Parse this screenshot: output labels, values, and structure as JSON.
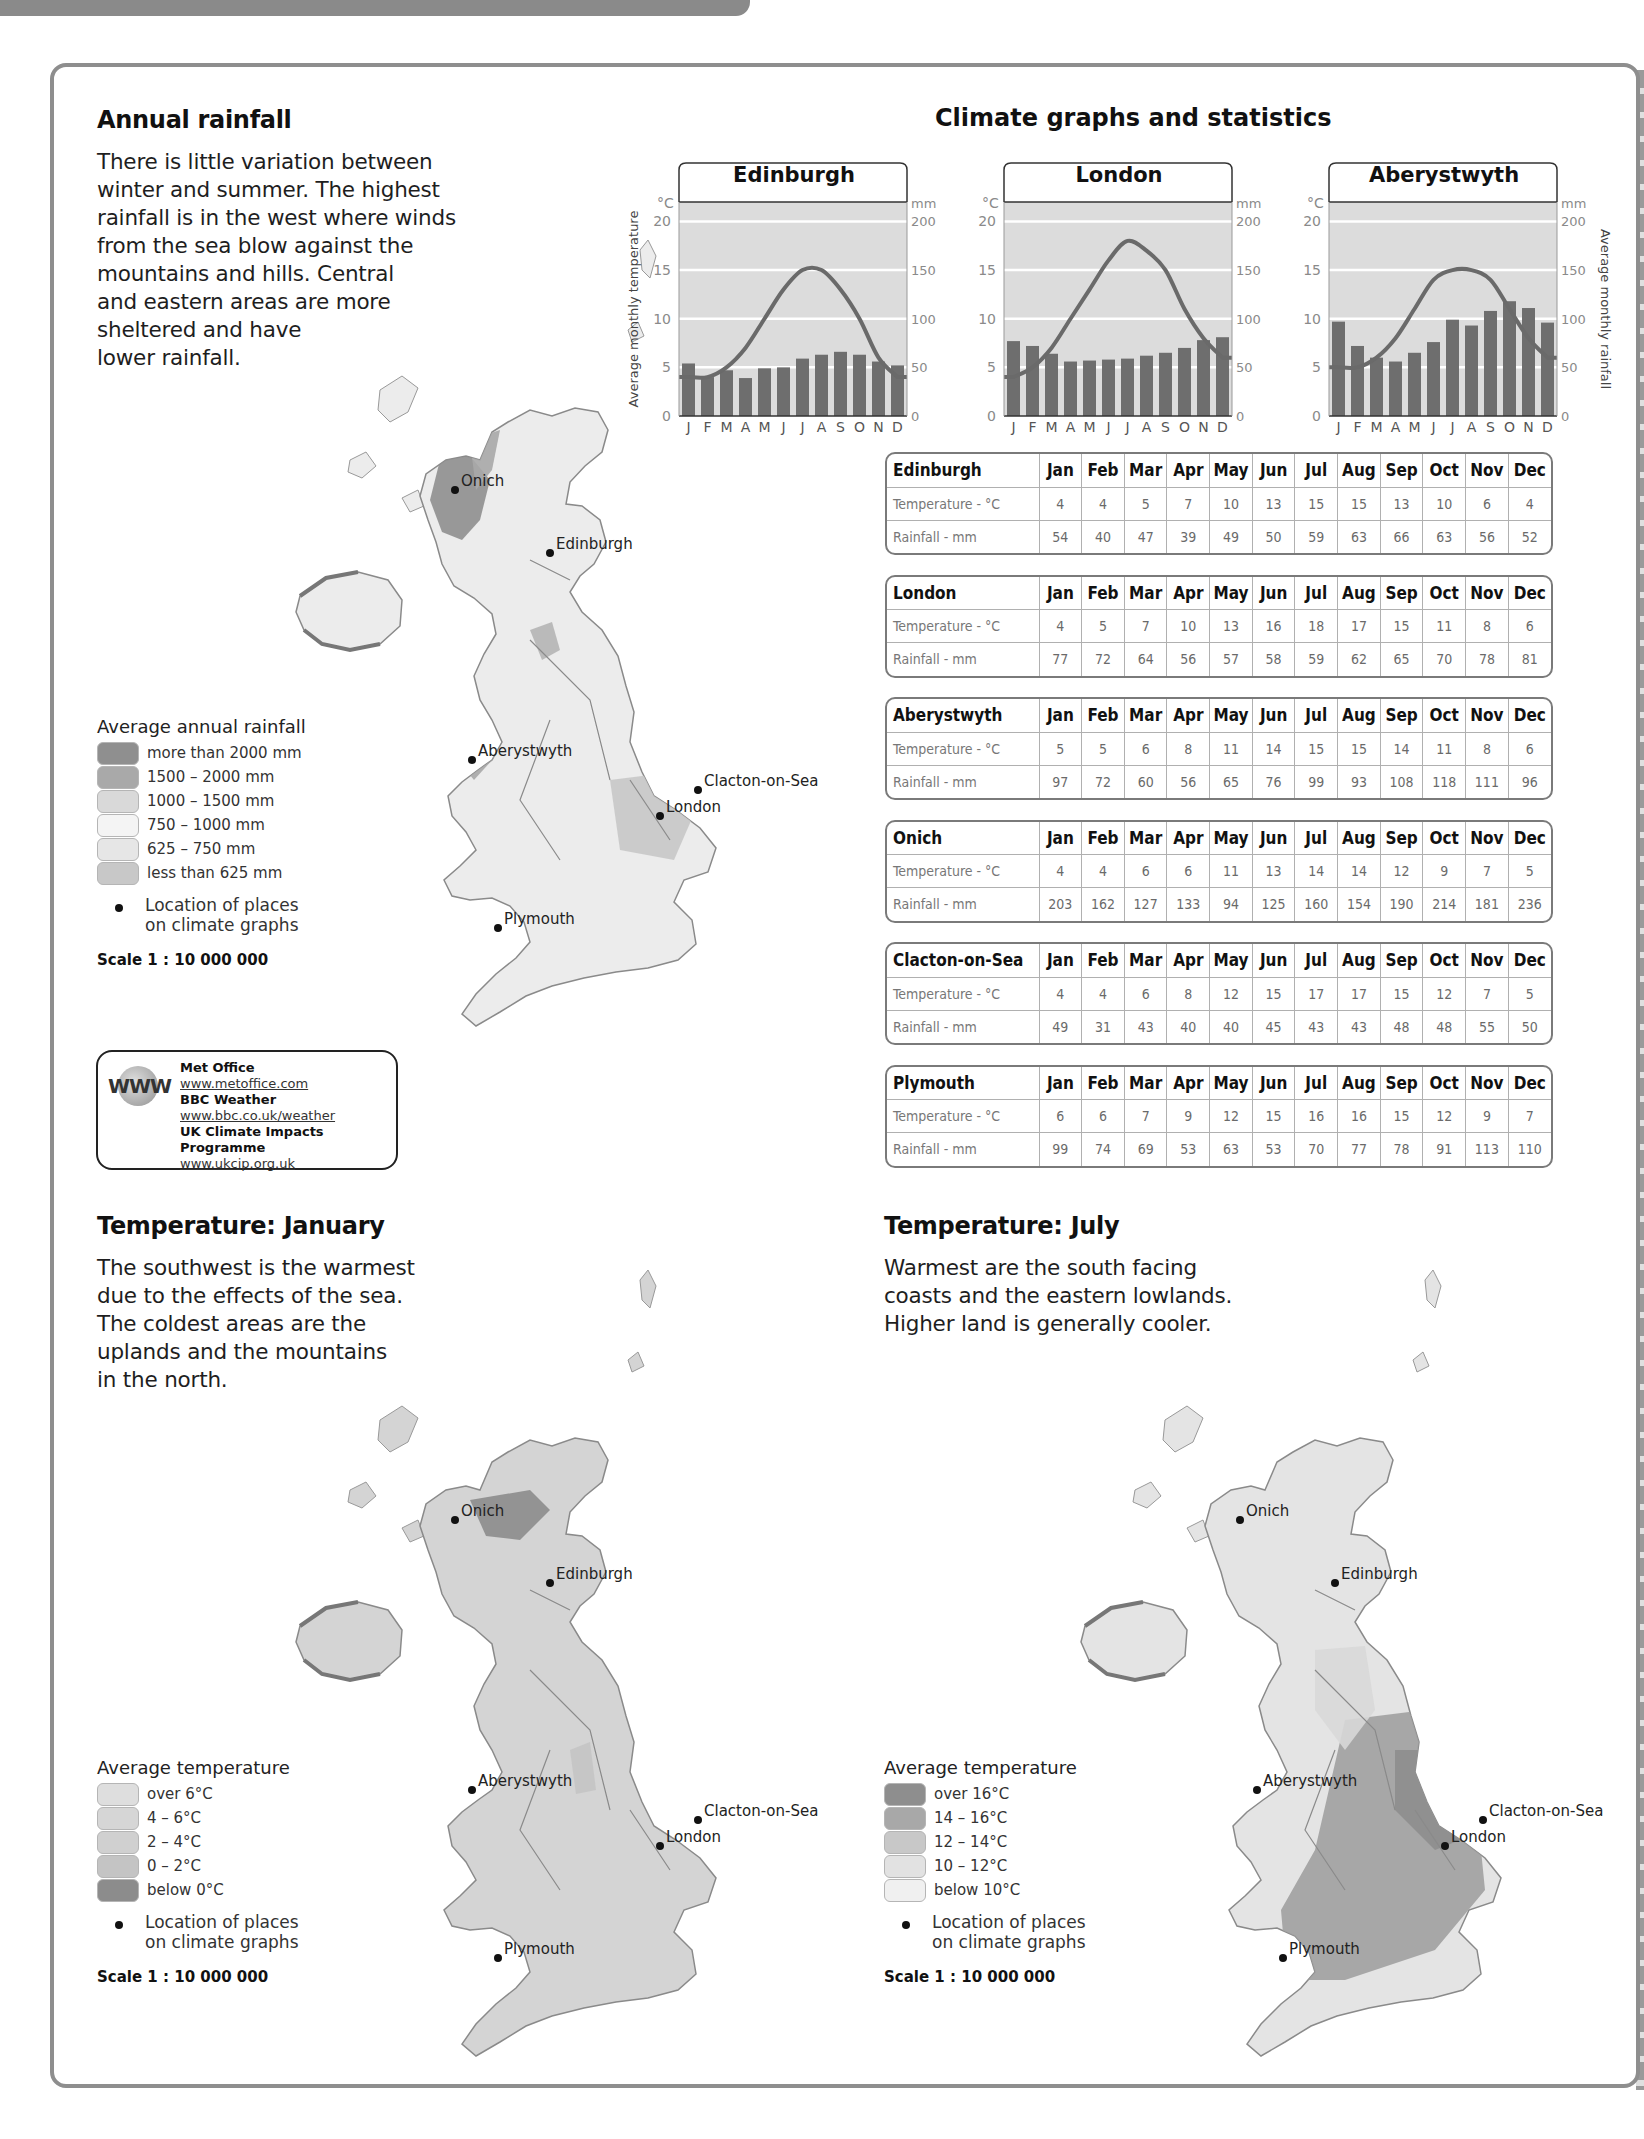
{
  "sections": {
    "rainfall": {
      "title": "Annual rainfall",
      "text": "There is little variation between\nwinter and summer. The highest\nrainfall is in the west where winds\nfrom the sea blow against the\nmountains and hills. Central\nand eastern areas are more\nsheltered and have\nlower rainfall."
    },
    "january": {
      "title": "Temperature: January",
      "text": "The southwest is the warmest\ndue to the effects of the sea.\nThe coldest areas are the\nuplands and the mountains\nin the north."
    },
    "july": {
      "title": "Temperature: July",
      "text": "Warmest are the south facing\ncoasts and the eastern lowlands.\nHigher land is generally cooler."
    },
    "climate": {
      "title": "Climate graphs and statistics"
    }
  },
  "legends": {
    "rainfall": {
      "title": "Average annual rainfall",
      "items": [
        {
          "label": "more than 2000 mm",
          "color": "#8f8f8f"
        },
        {
          "label": "1500 – 2000 mm",
          "color": "#a9a9a9"
        },
        {
          "label": "1000 – 1500 mm",
          "color": "#d9d9d9"
        },
        {
          "label": "750 – 1000 mm",
          "color": "#f4f4f4"
        },
        {
          "label": "625 – 750 mm",
          "color": "#e6e6e6"
        },
        {
          "label": "less than 625 mm",
          "color": "#c8c8c8"
        }
      ],
      "location": "Location of places\non climate graphs",
      "scale": "Scale 1 : 10 000 000"
    },
    "january": {
      "title": "Average temperature",
      "items": [
        {
          "label": "over 6°C",
          "color": "#dedede"
        },
        {
          "label": "4 – 6°C",
          "color": "#d6d6d6"
        },
        {
          "label": "2 – 4°C",
          "color": "#d0d0d0"
        },
        {
          "label": "0 – 2°C",
          "color": "#c4c4c4"
        },
        {
          "label": "below 0°C",
          "color": "#8c8c8c"
        }
      ],
      "location": "Location of places\non climate graphs",
      "scale": "Scale 1 : 10 000 000"
    },
    "july": {
      "title": "Average temperature",
      "items": [
        {
          "label": "over 16°C",
          "color": "#8e8e8e"
        },
        {
          "label": "14 – 16°C",
          "color": "#a8a8a8"
        },
        {
          "label": "12 – 14°C",
          "color": "#c8c8c8"
        },
        {
          "label": "10 – 12°C",
          "color": "#e2e2e2"
        },
        {
          "label": "below 10°C",
          "color": "#f0f0f0"
        }
      ],
      "location": "Location of places\non climate graphs",
      "scale": "Scale 1 : 10 000 000"
    }
  },
  "web_links": {
    "logo": "WWW",
    "items": [
      {
        "name": "Met Office",
        "url": "www.metoffice.com"
      },
      {
        "name": "BBC Weather",
        "url": "www.bbc.co.uk/weather"
      },
      {
        "name": "UK Climate Impacts Programme",
        "url": "www.ukcip.org.uk"
      }
    ]
  },
  "places": [
    "Onich",
    "Edinburgh",
    "Aberystwyth",
    "Clacton-on-Sea",
    "London",
    "Plymouth"
  ],
  "chart_axes": {
    "left_unit": "°C",
    "right_unit": "mm",
    "left_label": "Average monthly temperature",
    "right_label": "Average monthly rainfall",
    "left_ticks": [
      0,
      5,
      10,
      15,
      20
    ],
    "right_ticks": [
      0,
      50,
      100,
      150,
      200
    ],
    "month_initials": [
      "J",
      "F",
      "M",
      "A",
      "M",
      "J",
      "J",
      "A",
      "S",
      "O",
      "N",
      "D"
    ]
  },
  "table_header": {
    "months": [
      "Jan",
      "Feb",
      "Mar",
      "Apr",
      "May",
      "Jun",
      "Jul",
      "Aug",
      "Sep",
      "Oct",
      "Nov",
      "Dec"
    ],
    "temp_label": "Temperature - °C",
    "rain_label": "Rainfall - mm"
  },
  "chart_data": [
    {
      "type": "bar+line",
      "title": "Edinburgh",
      "categories": [
        "J",
        "F",
        "M",
        "A",
        "M",
        "J",
        "J",
        "A",
        "S",
        "O",
        "N",
        "D"
      ],
      "series": [
        {
          "name": "Rainfall (mm)",
          "type": "bar",
          "axis": "right",
          "values": [
            54,
            40,
            47,
            39,
            49,
            50,
            59,
            63,
            66,
            63,
            56,
            52
          ]
        },
        {
          "name": "Temperature (°C)",
          "type": "line",
          "axis": "left",
          "values": [
            4,
            4,
            5,
            7,
            10,
            13,
            15,
            15,
            13,
            10,
            6,
            4
          ]
        }
      ],
      "ylabel": "Average monthly temperature",
      "y2label": "Average monthly rainfall",
      "ylim": [
        0,
        22
      ],
      "y2lim": [
        0,
        220
      ],
      "grid": true
    },
    {
      "type": "bar+line",
      "title": "London",
      "categories": [
        "J",
        "F",
        "M",
        "A",
        "M",
        "J",
        "J",
        "A",
        "S",
        "O",
        "N",
        "D"
      ],
      "series": [
        {
          "name": "Rainfall (mm)",
          "type": "bar",
          "axis": "right",
          "values": [
            77,
            72,
            64,
            56,
            57,
            58,
            59,
            62,
            65,
            70,
            78,
            81
          ]
        },
        {
          "name": "Temperature (°C)",
          "type": "line",
          "axis": "left",
          "values": [
            4,
            5,
            7,
            10,
            13,
            16,
            18,
            17,
            15,
            11,
            8,
            6
          ]
        }
      ],
      "ylim": [
        0,
        22
      ],
      "y2lim": [
        0,
        220
      ],
      "grid": true
    },
    {
      "type": "bar+line",
      "title": "Aberystwyth",
      "categories": [
        "J",
        "F",
        "M",
        "A",
        "M",
        "J",
        "J",
        "A",
        "S",
        "O",
        "N",
        "D"
      ],
      "series": [
        {
          "name": "Rainfall (mm)",
          "type": "bar",
          "axis": "right",
          "values": [
            97,
            72,
            60,
            56,
            65,
            76,
            99,
            93,
            108,
            118,
            111,
            96
          ]
        },
        {
          "name": "Temperature (°C)",
          "type": "line",
          "axis": "left",
          "values": [
            5,
            5,
            6,
            8,
            11,
            14,
            15,
            15,
            14,
            11,
            8,
            6
          ]
        }
      ],
      "ylim": [
        0,
        22
      ],
      "y2lim": [
        0,
        220
      ],
      "grid": true
    },
    {
      "type": "table",
      "title": "Climate statistics",
      "columns": [
        "Jan",
        "Feb",
        "Mar",
        "Apr",
        "May",
        "Jun",
        "Jul",
        "Aug",
        "Sep",
        "Oct",
        "Nov",
        "Dec"
      ],
      "rows": [
        {
          "place": "Edinburgh",
          "temperature": [
            4,
            4,
            5,
            7,
            10,
            13,
            15,
            15,
            13,
            10,
            6,
            4
          ],
          "rainfall": [
            54,
            40,
            47,
            39,
            49,
            50,
            59,
            63,
            66,
            63,
            56,
            52
          ]
        },
        {
          "place": "London",
          "temperature": [
            4,
            5,
            7,
            10,
            13,
            16,
            18,
            17,
            15,
            11,
            8,
            6
          ],
          "rainfall": [
            77,
            72,
            64,
            56,
            57,
            58,
            59,
            62,
            65,
            70,
            78,
            81
          ]
        },
        {
          "place": "Aberystwyth",
          "temperature": [
            5,
            5,
            6,
            8,
            11,
            14,
            15,
            15,
            14,
            11,
            8,
            6
          ],
          "rainfall": [
            97,
            72,
            60,
            56,
            65,
            76,
            99,
            93,
            108,
            118,
            111,
            96
          ]
        },
        {
          "place": "Onich",
          "temperature": [
            4,
            4,
            6,
            6,
            11,
            13,
            14,
            14,
            12,
            9,
            7,
            5
          ],
          "rainfall": [
            203,
            162,
            127,
            133,
            94,
            125,
            160,
            154,
            190,
            214,
            181,
            236
          ]
        },
        {
          "place": "Clacton-on-Sea",
          "temperature": [
            4,
            4,
            6,
            8,
            12,
            15,
            17,
            17,
            15,
            12,
            7,
            5
          ],
          "rainfall": [
            49,
            31,
            43,
            40,
            40,
            45,
            43,
            43,
            48,
            48,
            55,
            50
          ]
        },
        {
          "place": "Plymouth",
          "temperature": [
            6,
            6,
            7,
            9,
            12,
            15,
            16,
            16,
            15,
            12,
            9,
            7
          ],
          "rainfall": [
            99,
            74,
            69,
            53,
            63,
            53,
            70,
            77,
            78,
            91,
            113,
            110
          ]
        }
      ]
    }
  ],
  "colors": {
    "chart_bg": "#dcdcdc",
    "bar": "#6e6e6e",
    "line": "#6a6a6a",
    "grid": "#ffffff",
    "frame": "#8e8e8e",
    "axis_text": "#8a8a8a"
  }
}
